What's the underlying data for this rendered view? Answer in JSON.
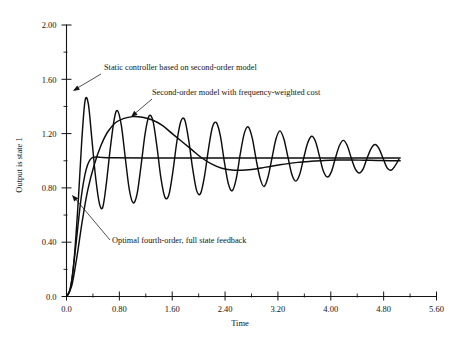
{
  "chart_data": {
    "type": "line",
    "title": "",
    "xlabel": "Time",
    "ylabel": "Output is state 1",
    "xlim": [
      0.0,
      5.6
    ],
    "ylim": [
      0.0,
      2.0
    ],
    "grid": false,
    "legend_position": "inline-annotations",
    "xticks": [
      "0.0",
      "0.80",
      "1.60",
      "2.40",
      "3.20",
      "4.00",
      "4.80",
      "5.60"
    ],
    "xtick_values": [
      0.0,
      0.8,
      1.6,
      2.4,
      3.2,
      4.0,
      4.8,
      5.6
    ],
    "yticks": [
      "0.0",
      "0.40",
      "0.80",
      "1.20",
      "1.60",
      "2.00"
    ],
    "ytick_values": [
      0.0,
      0.4,
      0.8,
      1.2,
      1.6,
      2.0
    ],
    "minor_tick_subdivisions": 2,
    "series": [
      {
        "name": "Static controller based on second-order model",
        "description": "Lightly damped high-frequency oscillation, first peak 1.44 near t=0.28, slowly decaying toward steady state 1.0, ends near t=5.05",
        "steady_state": 1.0,
        "first_peak": 1.44,
        "first_peak_time": 0.28,
        "points": [
          [
            0.0,
            0.0
          ],
          [
            0.06,
            0.06
          ],
          [
            0.12,
            0.3
          ],
          [
            0.18,
            0.72
          ],
          [
            0.23,
            1.14
          ],
          [
            0.28,
            1.44
          ],
          [
            0.33,
            1.42
          ],
          [
            0.38,
            1.18
          ],
          [
            0.44,
            0.88
          ],
          [
            0.5,
            0.68
          ],
          [
            0.55,
            0.66
          ],
          [
            0.6,
            0.82
          ],
          [
            0.66,
            1.08
          ],
          [
            0.72,
            1.3
          ],
          [
            0.77,
            1.37
          ],
          [
            0.83,
            1.26
          ],
          [
            0.89,
            1.02
          ],
          [
            0.95,
            0.79
          ],
          [
            1.01,
            0.69
          ],
          [
            1.07,
            0.76
          ],
          [
            1.13,
            0.97
          ],
          [
            1.19,
            1.2
          ],
          [
            1.25,
            1.33
          ],
          [
            1.31,
            1.29
          ],
          [
            1.37,
            1.1
          ],
          [
            1.43,
            0.87
          ],
          [
            1.49,
            0.73
          ],
          [
            1.55,
            0.75
          ],
          [
            1.61,
            0.92
          ],
          [
            1.67,
            1.14
          ],
          [
            1.73,
            1.29
          ],
          [
            1.79,
            1.3
          ],
          [
            1.85,
            1.15
          ],
          [
            1.91,
            0.94
          ],
          [
            1.97,
            0.78
          ],
          [
            2.03,
            0.76
          ],
          [
            2.09,
            0.89
          ],
          [
            2.15,
            1.09
          ],
          [
            2.21,
            1.25
          ],
          [
            2.27,
            1.28
          ],
          [
            2.33,
            1.18
          ],
          [
            2.39,
            0.99
          ],
          [
            2.45,
            0.83
          ],
          [
            2.51,
            0.78
          ],
          [
            2.57,
            0.87
          ],
          [
            2.63,
            1.05
          ],
          [
            2.69,
            1.2
          ],
          [
            2.75,
            1.25
          ],
          [
            2.81,
            1.17
          ],
          [
            2.87,
            1.01
          ],
          [
            2.93,
            0.87
          ],
          [
            2.99,
            0.81
          ],
          [
            3.05,
            0.88
          ],
          [
            3.11,
            1.02
          ],
          [
            3.17,
            1.16
          ],
          [
            3.23,
            1.22
          ],
          [
            3.29,
            1.16
          ],
          [
            3.35,
            1.03
          ],
          [
            3.41,
            0.9
          ],
          [
            3.47,
            0.85
          ],
          [
            3.53,
            0.9
          ],
          [
            3.59,
            1.02
          ],
          [
            3.65,
            1.13
          ],
          [
            3.71,
            1.18
          ],
          [
            3.77,
            1.14
          ],
          [
            3.83,
            1.03
          ],
          [
            3.89,
            0.92
          ],
          [
            3.95,
            0.88
          ],
          [
            4.01,
            0.92
          ],
          [
            4.07,
            1.02
          ],
          [
            4.13,
            1.11
          ],
          [
            4.19,
            1.15
          ],
          [
            4.25,
            1.11
          ],
          [
            4.31,
            1.02
          ],
          [
            4.37,
            0.94
          ],
          [
            4.43,
            0.91
          ],
          [
            4.49,
            0.94
          ],
          [
            4.55,
            1.02
          ],
          [
            4.61,
            1.09
          ],
          [
            4.67,
            1.12
          ],
          [
            4.73,
            1.09
          ],
          [
            4.79,
            1.02
          ],
          [
            4.85,
            0.95
          ],
          [
            4.91,
            0.93
          ],
          [
            4.97,
            0.96
          ],
          [
            5.03,
            1.01
          ]
        ]
      },
      {
        "name": "Second-order model with frequency-weighted cost",
        "description": "Slow broad overshoot peaking 1.32 near t=1.15, dipping to 0.93 near t=2.4, settling at 1.0",
        "steady_state": 1.0,
        "first_peak": 1.32,
        "first_peak_time": 1.15,
        "points": [
          [
            0.0,
            0.0
          ],
          [
            0.08,
            0.08
          ],
          [
            0.16,
            0.3
          ],
          [
            0.24,
            0.56
          ],
          [
            0.32,
            0.78
          ],
          [
            0.42,
            0.97
          ],
          [
            0.52,
            1.11
          ],
          [
            0.62,
            1.21
          ],
          [
            0.74,
            1.28
          ],
          [
            0.86,
            1.31
          ],
          [
            1.0,
            1.325
          ],
          [
            1.15,
            1.32
          ],
          [
            1.3,
            1.3
          ],
          [
            1.45,
            1.26
          ],
          [
            1.6,
            1.2
          ],
          [
            1.75,
            1.14
          ],
          [
            1.9,
            1.08
          ],
          [
            2.05,
            1.02
          ],
          [
            2.2,
            0.975
          ],
          [
            2.35,
            0.945
          ],
          [
            2.5,
            0.932
          ],
          [
            2.65,
            0.93
          ],
          [
            2.8,
            0.936
          ],
          [
            2.95,
            0.947
          ],
          [
            3.1,
            0.96
          ],
          [
            3.3,
            0.975
          ],
          [
            3.5,
            0.988
          ],
          [
            3.7,
            0.996
          ],
          [
            3.9,
            1.002
          ],
          [
            4.1,
            1.005
          ],
          [
            4.3,
            1.006
          ],
          [
            4.5,
            1.004
          ],
          [
            4.7,
            1.002
          ],
          [
            4.9,
            1.0
          ],
          [
            5.05,
            1.0
          ]
        ]
      },
      {
        "name": "Optimal fourth-order, full state feedback",
        "description": "Fast well-damped rise to steady state 1.02 by t=0.55, essentially flat thereafter",
        "steady_state": 1.02,
        "points": [
          [
            0.0,
            0.0
          ],
          [
            0.04,
            0.03
          ],
          [
            0.08,
            0.12
          ],
          [
            0.12,
            0.28
          ],
          [
            0.16,
            0.46
          ],
          [
            0.2,
            0.64
          ],
          [
            0.24,
            0.79
          ],
          [
            0.28,
            0.9
          ],
          [
            0.32,
            0.97
          ],
          [
            0.36,
            1.01
          ],
          [
            0.4,
            1.025
          ],
          [
            0.45,
            1.028
          ],
          [
            0.52,
            1.025
          ],
          [
            0.7,
            1.022
          ],
          [
            1.2,
            1.02
          ],
          [
            2.0,
            1.02
          ],
          [
            3.0,
            1.02
          ],
          [
            4.0,
            1.02
          ],
          [
            5.05,
            1.02
          ]
        ]
      }
    ],
    "annotations": [
      {
        "id": "static-controller",
        "text": "Static controller based on second-order model",
        "text_x": 104,
        "text_y": 70,
        "leader": [
          [
            101,
            74
          ],
          [
            74,
            90
          ]
        ],
        "arrow_at": [
          73,
          91
        ]
      },
      {
        "id": "frequency-weighted",
        "text": "Second-order model with frequency-weighted cost",
        "text_x": 152,
        "text_y": 95,
        "leader": [
          [
            152,
            99
          ],
          [
            132,
            116
          ]
        ],
        "arrow_at": [
          131,
          117
        ]
      },
      {
        "id": "optimal-fourth-order",
        "text": "Optimal fourth-order, full state feedback",
        "text_x": 112,
        "text_y": 243,
        "leader": [
          [
            110,
            240
          ],
          [
            73,
            196
          ]
        ],
        "arrow_at": [
          72,
          195
        ]
      }
    ]
  }
}
